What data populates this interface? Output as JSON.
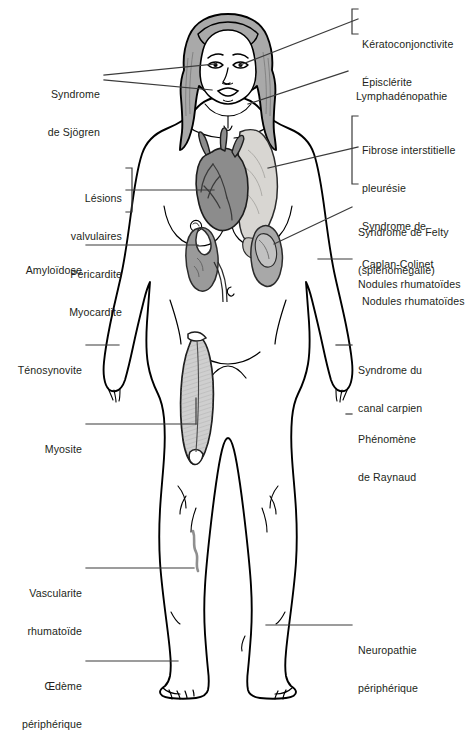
{
  "figure": {
    "kind": "anatomical-illustration",
    "language": "fr",
    "colors": {
      "outline": "#000000",
      "label_text": "#231f20",
      "leader_line": "#3b3b3b",
      "background": "#ffffff",
      "skin": "#ffffff",
      "hair": "#a9a9a9",
      "heart": "#8c8c8c",
      "lung": "#d8d6d2",
      "kidney": "#9a9a9a",
      "spleen": "#a8a8a8",
      "muscle": "#cfcfcf",
      "vasculitis": "#8f8f8f"
    },
    "organs": [
      {
        "name": "hair",
        "label": "cheveux"
      },
      {
        "name": "heart",
        "label": "coeur"
      },
      {
        "name": "lung",
        "label": "poumon"
      },
      {
        "name": "kidney",
        "label": "rein"
      },
      {
        "name": "spleen",
        "label": "rate"
      },
      {
        "name": "quadriceps-muscle",
        "label": "muscle quadriceps"
      },
      {
        "name": "vasculitis-lesion",
        "label": "lesion de vascularite"
      }
    ]
  },
  "labels_left": [
    {
      "id": "sjogren",
      "lines": [
        "Syndrome",
        "de Sjögren"
      ],
      "bracket": false,
      "leaders": 2
    },
    {
      "id": "cardiac-group",
      "lines": [
        "Lésions",
        "valvulaires",
        "Péricardite",
        "Myocardite"
      ],
      "bracket": true,
      "leaders": 1
    },
    {
      "id": "amylose",
      "lines": [
        "Amyloïdose"
      ],
      "bracket": false,
      "leaders": 1
    },
    {
      "id": "tenosynovite",
      "lines": [
        "Ténosynovite"
      ],
      "bracket": false,
      "leaders": 1
    },
    {
      "id": "myosite",
      "lines": [
        "Myosite"
      ],
      "bracket": false,
      "leaders": 1
    },
    {
      "id": "vascularite",
      "lines": [
        "Vascularite",
        "rhumatoïde"
      ],
      "bracket": false,
      "leaders": 1
    },
    {
      "id": "oedeme",
      "lines": [
        "Œdème",
        "périphérique"
      ],
      "bracket": false,
      "leaders": 1
    }
  ],
  "labels_right": [
    {
      "id": "oculaire-group",
      "lines": [
        "Kératoconjonctivite",
        "Épisclérite"
      ],
      "bracket": true,
      "leaders": 1
    },
    {
      "id": "lymphadenopathie",
      "lines": [
        "Lymphadénopathie"
      ],
      "bracket": false,
      "leaders": 1
    },
    {
      "id": "pulmonaire-group",
      "lines": [
        "Fibrose interstitielle",
        "pleurésie",
        "Syndrome de",
        "Caplan-Colinet",
        "Nodules rhumatoïdes"
      ],
      "bracket": true,
      "leaders": 1
    },
    {
      "id": "felty",
      "lines": [
        "Syndrome de Felty",
        "(splénomégalie)"
      ],
      "bracket": false,
      "leaders": 1
    },
    {
      "id": "nodules",
      "lines": [
        "Nodules rhumatoïdes"
      ],
      "bracket": false,
      "leaders": 1
    },
    {
      "id": "canal-carpien",
      "lines": [
        "Syndrome du",
        "canal carpien"
      ],
      "bracket": false,
      "leaders": 1
    },
    {
      "id": "raynaud",
      "lines": [
        "Phénomène",
        "de Raynaud"
      ],
      "bracket": false,
      "leaders": 1
    },
    {
      "id": "neuropathie",
      "lines": [
        "Neuropathie",
        "périphérique"
      ],
      "bracket": false,
      "leaders": 1
    }
  ]
}
